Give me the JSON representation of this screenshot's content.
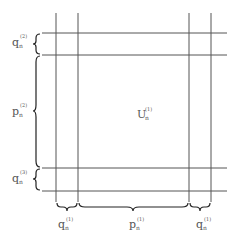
{
  "diagram": {
    "center_label": {
      "base": "U",
      "sub": "n",
      "sup": "(1)"
    },
    "left_labels": [
      {
        "id": "q-top",
        "base": "q",
        "sub": "n",
        "sup": "(2)"
      },
      {
        "id": "p-mid",
        "base": "p",
        "sub": "n",
        "sup": "(2)"
      },
      {
        "id": "q-bottom",
        "base": "q",
        "sub": "n",
        "sup": "(3)"
      }
    ],
    "bottom_labels": [
      {
        "id": "q-left",
        "base": "q",
        "sub": "n",
        "sup": "(1)"
      },
      {
        "id": "p-mid",
        "base": "p",
        "sub": "n",
        "sup": "(1)"
      },
      {
        "id": "q-right",
        "base": "q",
        "sub": "n",
        "sup": "(1)"
      }
    ]
  }
}
